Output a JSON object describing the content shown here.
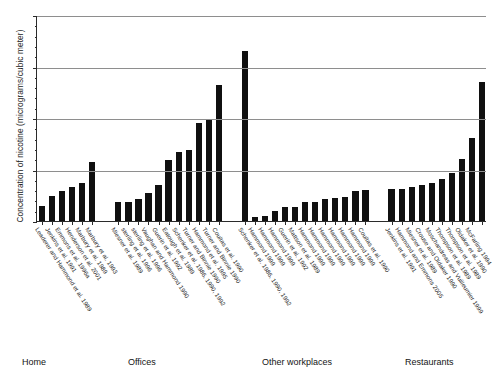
{
  "chart_data": {
    "type": "bar",
    "title": "",
    "subtitle": "",
    "xlabel": "",
    "ylabel": "Concentration of nicotine (micrograms/cubic meter)",
    "ylim": [
      0,
      20
    ],
    "yticks": [
      0,
      5,
      10,
      15,
      20
    ],
    "ytick_labels": [
      "0",
      "5",
      "10",
      "15",
      "20"
    ],
    "y_minor_ticks": [
      1,
      2,
      3,
      4,
      6,
      7,
      8,
      9,
      11,
      12,
      13,
      14,
      16,
      17,
      18,
      19
    ],
    "grid": "horizontal",
    "legend": "none",
    "bar_color": "#101010",
    "axis_color": "#2b2b2b",
    "grid_color": "#8e8e8e",
    "groups": [
      {
        "name": "Home",
        "label": "Home",
        "categories": [
          "Leaderer and Hammond et al. 1989",
          "Jenkins et al. 1991",
          "Emmons et al. 1996a",
          "Henderson et al. 2001",
          "Marbury et al. 1989",
          "Marbury et al. 1993"
        ],
        "values": [
          1.5,
          2.4,
          2.9,
          3.3,
          3.7,
          5.7
        ]
      },
      {
        "name": "Offices",
        "label": "Offices",
        "categories": [
          "Miesner et al. 1989",
          "sterling et al. 1996",
          "sterling et al. 1996",
          "Vaughan and Hammond 1990",
          "Guerin et al. 1992",
          "Eatough et al. 1989",
          "Schenker et al. 1986, 1990, 1992",
          "Turner and Binnie 1990",
          "Hammond et al. 1995",
          "Turner and Binnie 1990",
          "Coultas et al. 1990"
        ],
        "values": [
          1.8,
          1.8,
          2.1,
          2.7,
          3.5,
          5.9,
          6.7,
          6.9,
          9.5,
          9.8,
          13.2
        ]
      },
      {
        "name": "Other workplaces",
        "label": "Other workplaces",
        "categories": [
          "Schenker et al. 1986, 1990, 1992",
          "Hammond 1999",
          "Hammond 1999",
          "Hammond 1999",
          "Guerin et al. 1992",
          "Mattson et al. 1989",
          "Hammond 1999",
          "Hammond 1999",
          "Hammond 1999",
          "Hammond 1999",
          "Hammond 1999",
          "Hammond 1999",
          "Coultas et al. 1990"
        ],
        "values": [
          16.5,
          0.35,
          0.45,
          0.95,
          1.4,
          1.4,
          1.8,
          1.85,
          2.1,
          2.2,
          2.3,
          2.9,
          3.0
        ]
      },
      {
        "name": "Restaurants",
        "label": "Restaurants",
        "categories": [
          "Jenkins et al. 1991",
          "Hammond and Emmons 2005",
          "Miesner et al. 1989",
          "Crouse and Oldaker 1990",
          "Moschandreas and Vuilleumier 1999",
          "Thompson et al. 1989",
          "Thompson et al. 1989",
          "Oldaker et al. 1990",
          "McFarling 1994"
        ],
        "values": [
          3.1,
          3.1,
          3.3,
          3.5,
          3.7,
          4.1,
          4.7,
          6.0,
          8.1,
          13.5
        ]
      }
    ]
  }
}
